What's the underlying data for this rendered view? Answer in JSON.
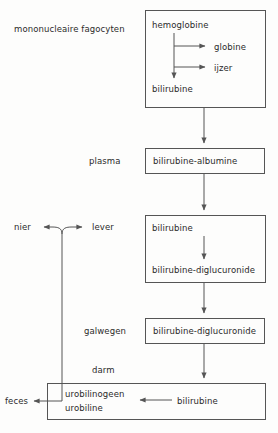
{
  "diagram": {
    "title_text": "mononucleaire fagocyten",
    "compartments": [
      {
        "id": "mps",
        "label": "mononucleaire fagocyten"
      },
      {
        "id": "plasma",
        "label": "plasma"
      },
      {
        "id": "nier",
        "label": "nier"
      },
      {
        "id": "lever",
        "label": "lever"
      },
      {
        "id": "galwegen",
        "label": "galwegen"
      },
      {
        "id": "darm",
        "label": "darm"
      },
      {
        "id": "feces",
        "label": "feces"
      }
    ],
    "boxes": [
      {
        "id": "box-mps",
        "items": [
          {
            "id": "hemoglobine",
            "label": "hemoglobine"
          },
          {
            "id": "bilirubine",
            "label": "bilirubine"
          }
        ],
        "branch_products": [
          {
            "id": "globine",
            "label": "globine"
          },
          {
            "id": "ijzer",
            "label": "ijzer"
          }
        ]
      },
      {
        "id": "box-plasma",
        "items": [
          {
            "id": "bilirubine-albumine",
            "label": "bilirubine-albumine"
          }
        ]
      },
      {
        "id": "box-lever",
        "items": [
          {
            "id": "bilirubine-lever",
            "label": "bilirubine"
          },
          {
            "id": "bilirubine-diglucuronide-lever",
            "label": "bilirubine-diglucuronide"
          }
        ]
      },
      {
        "id": "box-galwegen",
        "items": [
          {
            "id": "bilirubine-diglucuronide-gal",
            "label": "bilirubine-diglucuronide"
          }
        ]
      },
      {
        "id": "box-darm",
        "items": [
          {
            "id": "urobilinogeen",
            "label": "urobilinogeen"
          },
          {
            "id": "urobiline",
            "label": "urobiline"
          },
          {
            "id": "bilirubine-darm",
            "label": "bilirubine"
          }
        ]
      }
    ],
    "colors": {
      "stroke": "#555555",
      "text": "#2b2b2b",
      "background": "#fdfdfc"
    }
  }
}
